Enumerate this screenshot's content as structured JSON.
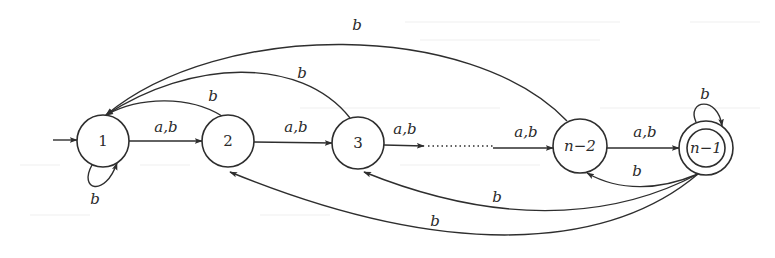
{
  "diagram": {
    "type": "finite-automaton",
    "start_state": "1",
    "accepting_states": [
      "n-1"
    ],
    "nodes": [
      {
        "id": "1",
        "label": "1",
        "cx": 103,
        "cy": 141,
        "r": 26,
        "accepting": false
      },
      {
        "id": "2",
        "label": "2",
        "cx": 228,
        "cy": 141,
        "r": 26,
        "accepting": false
      },
      {
        "id": "3",
        "label": "3",
        "cx": 358,
        "cy": 143,
        "r": 26,
        "accepting": false
      },
      {
        "id": "n-2",
        "label": "n−2",
        "cx": 580,
        "cy": 146,
        "r": 27,
        "accepting": false
      },
      {
        "id": "n-1",
        "label": "n−1",
        "cx": 706,
        "cy": 148,
        "r": 27,
        "accepting": true
      }
    ],
    "edges": [
      {
        "from": "1",
        "to": "2",
        "label": "a,b"
      },
      {
        "from": "2",
        "to": "3",
        "label": "a,b"
      },
      {
        "from": "3",
        "to": "...",
        "label": "a,b"
      },
      {
        "from": "...",
        "to": "n-2",
        "label": "a,b"
      },
      {
        "from": "n-2",
        "to": "n-1",
        "label": "a,b"
      },
      {
        "from": "1",
        "to": "1",
        "label": "b"
      },
      {
        "from": "n-1",
        "to": "n-1",
        "label": "b"
      },
      {
        "from": "2",
        "to": "1",
        "label": "b"
      },
      {
        "from": "3",
        "to": "1",
        "label": "b"
      },
      {
        "from": "n-2",
        "to": "1",
        "label": "b"
      },
      {
        "from": "n-1",
        "to": "n-2",
        "label": "b"
      },
      {
        "from": "n-1",
        "to": "3",
        "label": "b"
      },
      {
        "from": "n-1",
        "to": "2",
        "label": "b"
      }
    ],
    "labels": {
      "node_1": "1",
      "node_2": "2",
      "node_3": "3",
      "node_n2": "n−2",
      "node_n1": "n−1",
      "edge_1_2": "a,b",
      "edge_2_3": "a,b",
      "edge_3_dots": "a,b",
      "edge_dots_n2": "a,b",
      "edge_n2_n1": "a,b",
      "loop_1": "b",
      "loop_n1": "b",
      "back_2_1": "b",
      "back_3_1": "b",
      "back_n2_1": "b",
      "back_n1_n2": "b",
      "back_n1_3": "b",
      "back_n1_2": "b"
    },
    "colors": {
      "stroke": "#2e2e2e",
      "text": "#2a2a2a",
      "background": "#ffffff"
    }
  }
}
